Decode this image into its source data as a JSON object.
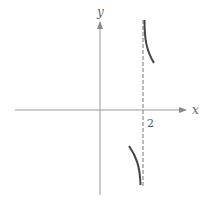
{
  "figure": {
    "type": "function sketch near vertical asymptote",
    "x_axis_label": "x",
    "y_axis_label": "y",
    "asymptote": {
      "orientation": "vertical",
      "x": 2,
      "style": "dashed"
    },
    "tick_labels": [
      {
        "axis": "x",
        "value": 2,
        "text": "2"
      }
    ],
    "branches": [
      {
        "side": "left of asymptote",
        "behavior": "y → -∞ as x → 2⁻"
      },
      {
        "side": "right of asymptote",
        "behavior": "y → +∞ as x → 2⁺"
      }
    ],
    "colors": {
      "axes": "#888888",
      "curve": "#444444",
      "asymptote": "#777777"
    }
  }
}
